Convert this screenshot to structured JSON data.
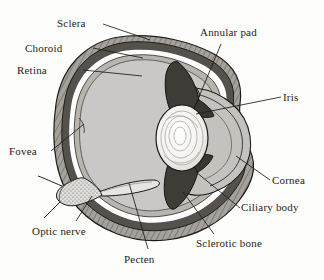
{
  "figure": {
    "background_color": "#fdfdfc",
    "ink_color": "#1d1c1a"
  },
  "palette": {
    "sclera_hatch": "#9a9791",
    "choroid_dark": "#4c4944",
    "retina_band": "#b4b1ab",
    "vitreous": "#c9c8c6",
    "anterior_chamber": "#bfbebc",
    "lens_white": "#f3f2ef",
    "ciliary_dark": "#3f3c38",
    "outline": "#1d1c1a",
    "white_gap": "#ffffff"
  },
  "labels": [
    {
      "id": "sclera",
      "text": "Sclera",
      "x": 57,
      "y": 17,
      "anchor": "start"
    },
    {
      "id": "choroid",
      "text": "Choroid",
      "x": 25,
      "y": 42,
      "anchor": "start"
    },
    {
      "id": "retina",
      "text": "Retina",
      "x": 17,
      "y": 64,
      "anchor": "start"
    },
    {
      "id": "annular-pad",
      "text": "Annular pad",
      "x": 200,
      "y": 26,
      "anchor": "start"
    },
    {
      "id": "iris",
      "text": "Iris",
      "x": 283,
      "y": 91,
      "anchor": "start"
    },
    {
      "id": "fovea",
      "text": "Fovea",
      "x": 9,
      "y": 145,
      "anchor": "start"
    },
    {
      "id": "cornea",
      "text": "Cornea",
      "x": 272,
      "y": 174,
      "anchor": "start"
    },
    {
      "id": "ciliary-body",
      "text": "Ciliary body",
      "x": 241,
      "y": 201,
      "anchor": "start"
    },
    {
      "id": "optic-nerve",
      "text": "Optic nerve",
      "x": 32,
      "y": 225,
      "anchor": "start"
    },
    {
      "id": "sclerotic-bone",
      "text": "Sclerotic bone",
      "x": 196,
      "y": 237,
      "anchor": "start"
    },
    {
      "id": "pecten",
      "text": "Pecten",
      "x": 124,
      "y": 253,
      "anchor": "start"
    }
  ],
  "leader_lines": [
    {
      "id": "leader-sclera",
      "d": "M103,24 L150,40"
    },
    {
      "id": "leader-choroid",
      "d": "M93,48 L143,58"
    },
    {
      "id": "leader-retina",
      "d": "M83,70 L142,76"
    },
    {
      "id": "leader-annular-pad",
      "d": "M221,44 L196,104"
    },
    {
      "id": "leader-iris",
      "d": "M281,97 L196,114"
    },
    {
      "id": "leader-fovea",
      "d": "M51,151 L84,124"
    },
    {
      "id": "leader-cornea",
      "d": "M270,180 L236,156"
    },
    {
      "id": "leader-ciliary-body",
      "d": "M240,208 L196,172"
    },
    {
      "id": "leader-optic-nerve",
      "d": "M76,221 L92,196"
    },
    {
      "id": "leader-sclerotic-bone",
      "d": "M214,234 L183,192"
    },
    {
      "id": "leader-pecten",
      "d": "M148,249 L129,183"
    }
  ],
  "structures": [
    {
      "id": "sclera",
      "name": "Sclera",
      "description": "outer hatched fibrous coat"
    },
    {
      "id": "choroid",
      "name": "Choroid",
      "description": "dark pigmented middle layer"
    },
    {
      "id": "retina",
      "name": "Retina",
      "description": "inner light band"
    },
    {
      "id": "vitreous",
      "name": "Vitreous chamber",
      "description": "large grey interior"
    },
    {
      "id": "lens",
      "name": "Lens",
      "description": "whitish ringed oval"
    },
    {
      "id": "annular-pad",
      "name": "Annular pad",
      "description": "dark wedge around lens equator"
    },
    {
      "id": "iris",
      "name": "Iris",
      "description": "dark flap bounding pupil"
    },
    {
      "id": "cornea",
      "name": "Cornea",
      "description": "clear anterior dome"
    },
    {
      "id": "ciliary-body",
      "name": "Ciliary body",
      "description": "dark ring at lens base"
    },
    {
      "id": "sclerotic-bone",
      "name": "Sclerotic bone",
      "description": "bony ring in anterior sclera"
    },
    {
      "id": "optic-nerve",
      "name": "Optic nerve",
      "description": "stippled stalk at lower left"
    },
    {
      "id": "fovea",
      "name": "Fovea",
      "description": "retinal pit on posterior wall"
    },
    {
      "id": "pecten",
      "name": "Pecten",
      "description": "blade projecting into vitreous"
    }
  ]
}
